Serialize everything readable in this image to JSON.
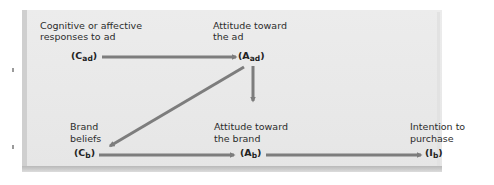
{
  "diagram": {
    "type": "flow",
    "nodes": [
      {
        "id": "cad",
        "label_line1": "Cognitive or affective",
        "label_line2": "responses to ad",
        "symbol_open": "(C",
        "symbol_sub": "ad",
        "symbol_close": ")"
      },
      {
        "id": "aad",
        "label_line1": "Attitude toward",
        "label_line2": "the ad",
        "symbol_open": "(A",
        "symbol_sub": "ad",
        "symbol_close": ")"
      },
      {
        "id": "cb",
        "label_line1": "Brand",
        "label_line2": "beliefs",
        "symbol_open": "(C",
        "symbol_sub": "b",
        "symbol_close": ")"
      },
      {
        "id": "ab",
        "label_line1": "Attitude toward",
        "label_line2": "the brand",
        "symbol_open": "(A",
        "symbol_sub": "b",
        "symbol_close": ")"
      },
      {
        "id": "ib",
        "label_line1": "Intention to",
        "label_line2": "purchase",
        "symbol_open": "(I",
        "symbol_sub": "b",
        "symbol_close": ")"
      }
    ],
    "edges": [
      {
        "from": "cad",
        "to": "aad"
      },
      {
        "from": "aad",
        "to": "ab"
      },
      {
        "from": "aad",
        "to": "cb"
      },
      {
        "from": "cb",
        "to": "ab"
      },
      {
        "from": "ab",
        "to": "ib"
      }
    ],
    "colors": {
      "panel": "#e8e8e8",
      "arrow": "#7d7d7d",
      "text": "#2a2a2a"
    }
  }
}
